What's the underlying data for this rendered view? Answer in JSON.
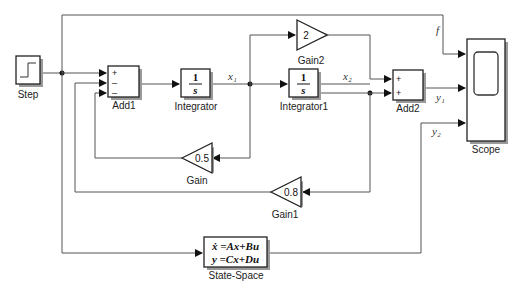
{
  "diagram": {
    "blocks": {
      "step": {
        "label": "Step"
      },
      "add1": {
        "label": "Add1",
        "signs": [
          "+",
          "–",
          "–"
        ]
      },
      "integrator": {
        "label": "Integrator",
        "num": "1",
        "den": "s"
      },
      "integrator1": {
        "label": "Integrator1",
        "num": "1",
        "den": "s"
      },
      "gain2": {
        "label": "Gain2",
        "value": "2"
      },
      "add2": {
        "label": "Add2",
        "signs": [
          "+",
          "+"
        ]
      },
      "scope": {
        "label": "Scope"
      },
      "gain": {
        "label": "Gain",
        "value": "0.5"
      },
      "gain1": {
        "label": "Gain1",
        "value": "0.8"
      },
      "statespace": {
        "label": "State-Space",
        "eq1": "ẋ =Ax+Bu",
        "eq2": "y =Cx+Du"
      }
    },
    "signals": {
      "x1": "x₁",
      "x2": "x₂",
      "y1": "y₁",
      "y2": "y₂",
      "f": "f"
    }
  }
}
